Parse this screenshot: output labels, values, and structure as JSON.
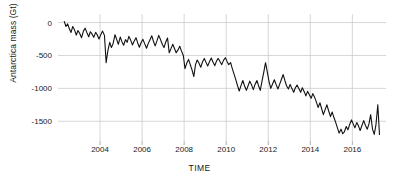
{
  "chart_data": {
    "type": "line",
    "title": "",
    "xlabel": "TIME",
    "ylabel": "Antarctica mass (Gt)",
    "xlim": [
      2002.0,
      2017.6
    ],
    "ylim": [
      -1800,
      130
    ],
    "grid": true,
    "legend": "none",
    "line_color": "#111111",
    "grid_color": "#cccccc",
    "background": "#ffffff",
    "xticks": [
      2004,
      2006,
      2008,
      2010,
      2012,
      2014,
      2016
    ],
    "xtick_labels": [
      "2004",
      "2006",
      "2008",
      "2010",
      "2012",
      "2014",
      "2016"
    ],
    "yticks": [
      0,
      -500,
      -1000,
      -1500
    ],
    "ytick_labels": [
      "0",
      "-500",
      "-1000",
      "-1500"
    ],
    "series": [
      {
        "name": "Antarctica mass anomaly",
        "x": [
          2002.3,
          2002.38,
          2002.46,
          2002.54,
          2002.62,
          2002.7,
          2002.79,
          2002.87,
          2002.95,
          2003.04,
          2003.12,
          2003.21,
          2003.29,
          2003.37,
          2003.46,
          2003.54,
          2003.62,
          2003.7,
          2003.79,
          2003.87,
          2003.95,
          2004.04,
          2004.12,
          2004.21,
          2004.29,
          2004.37,
          2004.46,
          2004.54,
          2004.62,
          2004.71,
          2004.79,
          2004.87,
          2004.96,
          2005.04,
          2005.12,
          2005.21,
          2005.29,
          2005.37,
          2005.46,
          2005.54,
          2005.62,
          2005.71,
          2005.79,
          2005.87,
          2005.96,
          2006.04,
          2006.12,
          2006.21,
          2006.29,
          2006.37,
          2006.46,
          2006.54,
          2006.62,
          2006.71,
          2006.79,
          2006.87,
          2006.96,
          2007.04,
          2007.12,
          2007.21,
          2007.29,
          2007.37,
          2007.46,
          2007.54,
          2007.62,
          2007.71,
          2007.79,
          2007.87,
          2007.96,
          2008.04,
          2008.12,
          2008.21,
          2008.29,
          2008.37,
          2008.46,
          2008.54,
          2008.62,
          2008.71,
          2008.79,
          2008.87,
          2008.96,
          2009.04,
          2009.12,
          2009.21,
          2009.29,
          2009.37,
          2009.46,
          2009.54,
          2009.62,
          2009.71,
          2009.79,
          2009.87,
          2009.96,
          2010.04,
          2010.12,
          2010.21,
          2010.29,
          2010.37,
          2010.46,
          2010.54,
          2010.62,
          2010.71,
          2010.79,
          2010.87,
          2010.96,
          2011.04,
          2011.12,
          2011.21,
          2011.29,
          2011.37,
          2011.46,
          2011.54,
          2011.62,
          2011.71,
          2011.79,
          2011.87,
          2011.96,
          2012.04,
          2012.12,
          2012.21,
          2012.29,
          2012.37,
          2012.46,
          2012.54,
          2012.62,
          2012.71,
          2012.79,
          2012.87,
          2012.96,
          2013.04,
          2013.12,
          2013.21,
          2013.29,
          2013.37,
          2013.46,
          2013.54,
          2013.62,
          2013.71,
          2013.79,
          2013.87,
          2013.96,
          2014.04,
          2014.12,
          2014.21,
          2014.29,
          2014.37,
          2014.46,
          2014.54,
          2014.62,
          2014.71,
          2014.79,
          2014.87,
          2014.96,
          2015.04,
          2015.12,
          2015.21,
          2015.29,
          2015.37,
          2015.46,
          2015.54,
          2015.62,
          2015.71,
          2015.79,
          2015.87,
          2015.96,
          2016.04,
          2016.12,
          2016.21,
          2016.29,
          2016.37,
          2016.46,
          2016.54,
          2016.62,
          2016.71,
          2016.79,
          2016.87,
          2016.96,
          2017.04,
          2017.12,
          2017.21,
          2017.29
        ],
        "y": [
          15,
          -60,
          -20,
          -95,
          -150,
          -60,
          -115,
          -190,
          -120,
          -170,
          -230,
          -130,
          -85,
          -150,
          -215,
          -140,
          -175,
          -225,
          -150,
          -190,
          -250,
          -180,
          -130,
          -195,
          -610,
          -430,
          -300,
          -380,
          -320,
          -185,
          -255,
          -330,
          -220,
          -290,
          -345,
          -260,
          -300,
          -210,
          -270,
          -340,
          -285,
          -230,
          -310,
          -375,
          -300,
          -255,
          -320,
          -390,
          -320,
          -265,
          -200,
          -285,
          -355,
          -275,
          -195,
          -255,
          -330,
          -380,
          -300,
          -235,
          -460,
          -400,
          -330,
          -395,
          -460,
          -415,
          -360,
          -430,
          -500,
          -700,
          -620,
          -560,
          -640,
          -715,
          -820,
          -640,
          -570,
          -620,
          -680,
          -600,
          -545,
          -605,
          -660,
          -590,
          -540,
          -600,
          -655,
          -585,
          -545,
          -595,
          -640,
          -575,
          -535,
          -590,
          -640,
          -610,
          -700,
          -780,
          -870,
          -960,
          -1040,
          -950,
          -880,
          -960,
          -1030,
          -960,
          -890,
          -950,
          -1020,
          -940,
          -880,
          -960,
          -1030,
          -880,
          -750,
          -610,
          -760,
          -900,
          -1000,
          -930,
          -870,
          -940,
          -1010,
          -940,
          -870,
          -790,
          -880,
          -960,
          -1010,
          -940,
          -1000,
          -1060,
          -990,
          -950,
          -1005,
          -1060,
          -990,
          -1050,
          -1115,
          -1045,
          -1100,
          -1150,
          -1080,
          -1140,
          -1210,
          -1290,
          -1220,
          -1310,
          -1400,
          -1320,
          -1250,
          -1340,
          -1430,
          -1360,
          -1440,
          -1520,
          -1600,
          -1680,
          -1620,
          -1690,
          -1660,
          -1580,
          -1630,
          -1550,
          -1480,
          -1540,
          -1600,
          -1520,
          -1570,
          -1640,
          -1560,
          -1490,
          -1560,
          -1620,
          -1540,
          -1400,
          -1620,
          -1700,
          -1560,
          -1250,
          -1700
        ]
      }
    ]
  }
}
